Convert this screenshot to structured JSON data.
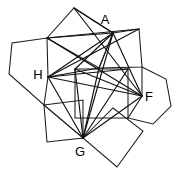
{
  "figure": {
    "canvas": {
      "width": 189,
      "height": 174,
      "background": "#ffffff"
    },
    "stroke_color": "#1a1a1a",
    "label_color": "#000000",
    "labels": [
      {
        "id": "A",
        "text": "A",
        "x": 105,
        "y": 21
      },
      {
        "id": "H",
        "text": "H",
        "x": 38,
        "y": 76
      },
      {
        "id": "F",
        "text": "F",
        "x": 149,
        "y": 98
      },
      {
        "id": "G",
        "text": "G",
        "x": 80,
        "y": 153
      }
    ],
    "named_vertices": {
      "A": {
        "x": 113,
        "y": 33
      },
      "H": {
        "x": 48,
        "y": 77
      },
      "F": {
        "x": 142,
        "y": 96
      },
      "G": {
        "x": 83,
        "y": 138
      }
    },
    "polygons": [
      {
        "name": "top-quadrilateral",
        "points": "74,8 113,33 99,68 47,38"
      },
      {
        "name": "upper-right-quadrilateral",
        "points": "113,33 139,29 142,67 99,68"
      },
      {
        "name": "left-pentagon",
        "points": "47,38 48,77 44,105 9,74 12,43"
      },
      {
        "name": "right-hexagon",
        "points": "142,67 166,79 171,106 153,124 128,118 142,96"
      },
      {
        "name": "bottom-left-square",
        "points": "44,105 83,100 83,138 47,142"
      },
      {
        "name": "bottom-right-square",
        "points": "83,138 113,108 143,131 117,167"
      },
      {
        "name": "inner-rectangle",
        "points": "75,69 128,69 128,118 75,118"
      }
    ],
    "chords": [
      {
        "name": "H-to-A",
        "x1": 48,
        "y1": 77,
        "x2": 113,
        "y2": 33
      },
      {
        "name": "H-to-F",
        "x1": 48,
        "y1": 77,
        "x2": 142,
        "y2": 96
      },
      {
        "name": "H-to-G",
        "x1": 48,
        "y1": 77,
        "x2": 83,
        "y2": 138
      },
      {
        "name": "H-to-upper-right",
        "x1": 48,
        "y1": 77,
        "x2": 139,
        "y2": 29
      },
      {
        "name": "H-to-inner-right",
        "x1": 48,
        "y1": 77,
        "x2": 128,
        "y2": 69
      },
      {
        "name": "H-to-inner-top",
        "x1": 48,
        "y1": 77,
        "x2": 99,
        "y2": 68
      },
      {
        "name": "A-to-G",
        "x1": 113,
        "y1": 33,
        "x2": 83,
        "y2": 138
      },
      {
        "name": "A-to-F",
        "x1": 113,
        "y1": 33,
        "x2": 142,
        "y2": 96
      },
      {
        "name": "A-to-left-vertex",
        "x1": 113,
        "y1": 33,
        "x2": 47,
        "y2": 38
      },
      {
        "name": "A-to-inner-left",
        "x1": 113,
        "y1": 33,
        "x2": 75,
        "y2": 69
      },
      {
        "name": "G-to-F",
        "x1": 83,
        "y1": 138,
        "x2": 142,
        "y2": 96
      },
      {
        "name": "G-to-upper-apex",
        "x1": 83,
        "y1": 138,
        "x2": 99,
        "y2": 68
      },
      {
        "name": "G-to-inner-left",
        "x1": 83,
        "y1": 138,
        "x2": 75,
        "y2": 69
      },
      {
        "name": "G-to-left-pentagon",
        "x1": 83,
        "y1": 138,
        "x2": 44,
        "y2": 105
      },
      {
        "name": "F-to-top-apex",
        "x1": 142,
        "y1": 96,
        "x2": 74,
        "y2": 8
      },
      {
        "name": "F-to-left-vertex",
        "x1": 142,
        "y1": 96,
        "x2": 47,
        "y2": 38
      },
      {
        "name": "F-to-inner-left",
        "x1": 142,
        "y1": 96,
        "x2": 75,
        "y2": 69
      },
      {
        "name": "top-apex-to-A",
        "x1": 74,
        "y1": 8,
        "x2": 113,
        "y2": 33
      },
      {
        "name": "upper-right-to-left-vertex",
        "x1": 139,
        "y1": 29,
        "x2": 47,
        "y2": 38
      },
      {
        "name": "inner-right-to-G",
        "x1": 128,
        "y1": 69,
        "x2": 83,
        "y2": 138
      }
    ]
  }
}
